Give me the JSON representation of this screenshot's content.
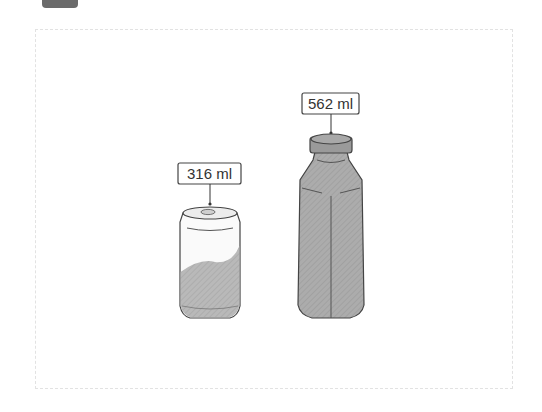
{
  "items": [
    {
      "name": "can",
      "label": "316 ml"
    },
    {
      "name": "bottle",
      "label": "562 ml"
    }
  ]
}
